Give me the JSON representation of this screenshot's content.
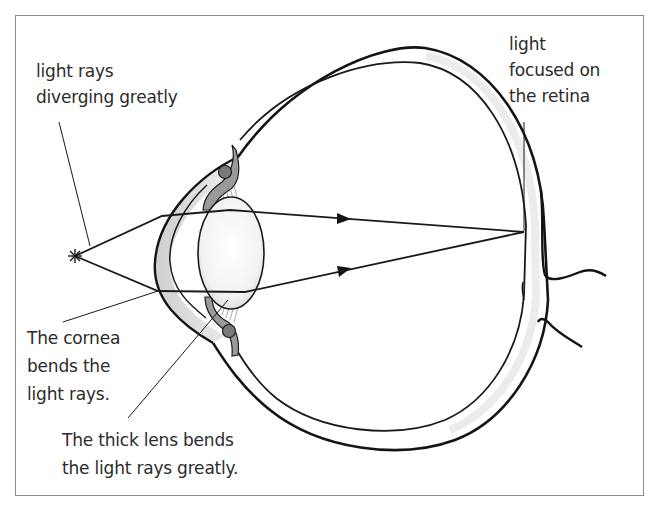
{
  "figure": {
    "type": "anatomical diagram",
    "colors": {
      "line": "#1a1a1a",
      "text": "#2b2b2b",
      "frame": "#8a8a8a",
      "tissue_shade": "#d9d9d9",
      "background": "#ffffff"
    }
  },
  "labels": {
    "source": {
      "lines": [
        "light rays",
        "diverging greatly"
      ]
    },
    "retina": {
      "lines": [
        "light",
        "focused on",
        "the retina"
      ]
    },
    "cornea": {
      "lines": [
        "The cornea",
        "bends the",
        "light rays."
      ]
    },
    "lens": {
      "lines": [
        "The thick lens bends",
        "the light rays greatly."
      ]
    }
  },
  "rays": {
    "source_point": [
      75,
      256
    ],
    "focal_point": [
      524,
      232
    ],
    "count": 2,
    "direction_arrows": 2
  }
}
